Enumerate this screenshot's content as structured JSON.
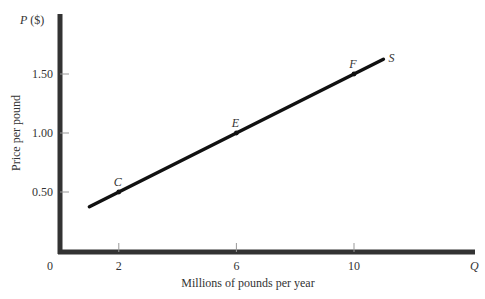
{
  "chart_data": {
    "type": "line",
    "title": "",
    "xlabel": "Millions of pounds per year",
    "ylabel": "Price per pound",
    "x_axis_symbol": "Q",
    "y_axis_symbol": "P ($)",
    "origin_label": "0",
    "x_ticks": [
      2,
      6,
      10
    ],
    "x_tick_labels": [
      "2",
      "6",
      "10"
    ],
    "y_ticks": [
      0.5,
      1.0,
      1.5
    ],
    "y_tick_labels": [
      "0.50",
      "1.00",
      "1.50"
    ],
    "xlim": [
      0,
      13
    ],
    "ylim": [
      0,
      1.9
    ],
    "grid": false,
    "series": [
      {
        "name": "S",
        "label": "S",
        "x": [
          1,
          11
        ],
        "y": [
          0.375,
          1.625
        ]
      }
    ],
    "points": [
      {
        "label": "C",
        "x": 2,
        "y": 0.5
      },
      {
        "label": "E",
        "x": 6,
        "y": 1.0
      },
      {
        "label": "F",
        "x": 10,
        "y": 1.5
      }
    ]
  }
}
